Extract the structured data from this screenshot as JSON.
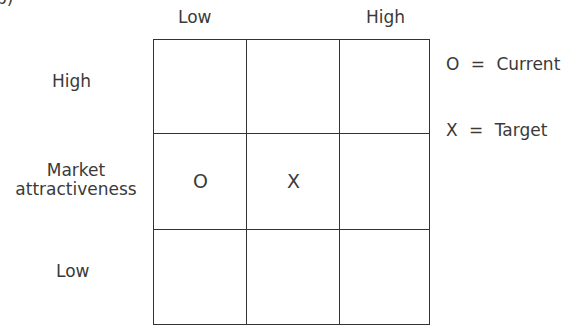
{
  "figure_label": "b)",
  "column_headers": {
    "left": "Low",
    "right": "High"
  },
  "row_labels": {
    "top": "High",
    "middle_line1": "Market",
    "middle_line2": "attractiveness",
    "bottom": "Low"
  },
  "grid": {
    "rows": 3,
    "cols": 3,
    "cells": [
      [
        "",
        "",
        ""
      ],
      [
        "O",
        "X",
        ""
      ],
      [
        "",
        "",
        ""
      ]
    ]
  },
  "legend": [
    {
      "symbol": "O",
      "separator": "=",
      "label": "Current"
    },
    {
      "symbol": "X",
      "separator": "=",
      "label": "Target"
    }
  ]
}
